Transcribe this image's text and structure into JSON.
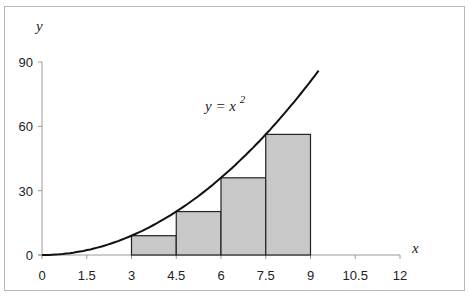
{
  "chart_data": {
    "type": "bar",
    "title": "",
    "xlabel": "x",
    "ylabel": "y",
    "xlim": [
      0,
      12
    ],
    "ylim": [
      0,
      90
    ],
    "x_ticks": [
      "0",
      "1.5",
      "3",
      "4.5",
      "6",
      "7.5",
      "9",
      "10.5",
      "12"
    ],
    "y_ticks": [
      "0",
      "30",
      "60",
      "90"
    ],
    "grid": false,
    "legend": null,
    "annotation": {
      "text": "y = x",
      "superscript": "2"
    },
    "curve": {
      "name": "y = x^2",
      "function": "x^2",
      "x_range": [
        0,
        9.27
      ]
    },
    "series": [
      {
        "name": "Left Riemann rectangles (width 1.5)",
        "x_left": [
          3,
          4.5,
          6,
          7.5
        ],
        "x_right": [
          4.5,
          6,
          7.5,
          9
        ],
        "values": [
          9,
          20.25,
          36,
          56.25
        ]
      }
    ],
    "colors": {
      "bar_fill": "#c8c8c8",
      "bar_stroke": "#222222",
      "curve": "#111111",
      "axis": "#9a9a9a"
    }
  }
}
